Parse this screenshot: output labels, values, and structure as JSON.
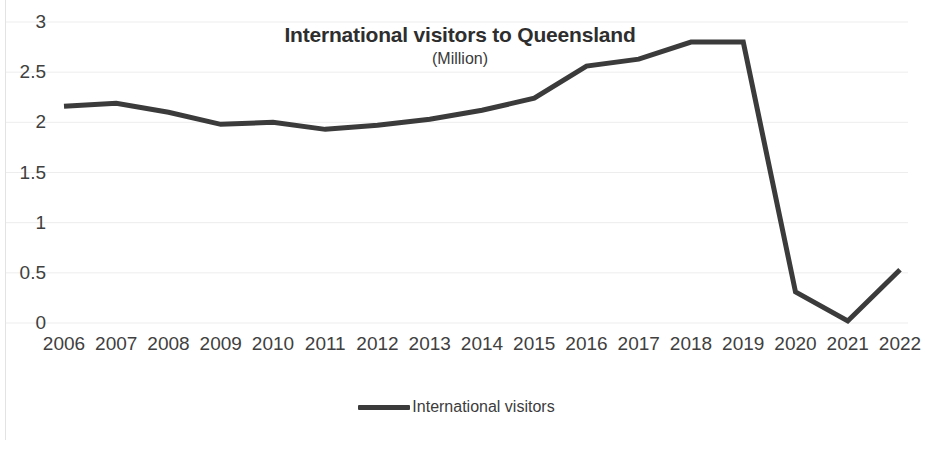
{
  "chart_data": {
    "type": "line",
    "title": "International visitors to Queensland",
    "subtitle": "(Million)",
    "xlabel": "",
    "ylabel": "",
    "categories": [
      "2006",
      "2007",
      "2008",
      "2009",
      "2010",
      "2011",
      "2012",
      "2013",
      "2014",
      "2015",
      "2016",
      "2017",
      "2018",
      "2019",
      "2020",
      "2021",
      "2022"
    ],
    "series": [
      {
        "name": "International visitors",
        "color": "#3b3b3b",
        "values": [
          2.16,
          2.19,
          2.1,
          1.98,
          2.0,
          1.93,
          1.97,
          2.03,
          2.12,
          2.24,
          2.56,
          2.63,
          2.8,
          2.8,
          0.31,
          0.02,
          0.53
        ]
      }
    ],
    "ylim": [
      0,
      3
    ],
    "yticks": [
      0,
      0.5,
      1,
      1.5,
      2,
      2.5,
      3
    ],
    "ytick_labels": [
      "0",
      "0.5",
      "1",
      "1.5",
      "2",
      "2.5",
      "3"
    ],
    "grid": "horizontal",
    "grid_color": "#ededed",
    "legend_position": "bottom",
    "background": "#ffffff"
  },
  "legend": {
    "items": [
      {
        "label": "International visitors"
      }
    ]
  }
}
